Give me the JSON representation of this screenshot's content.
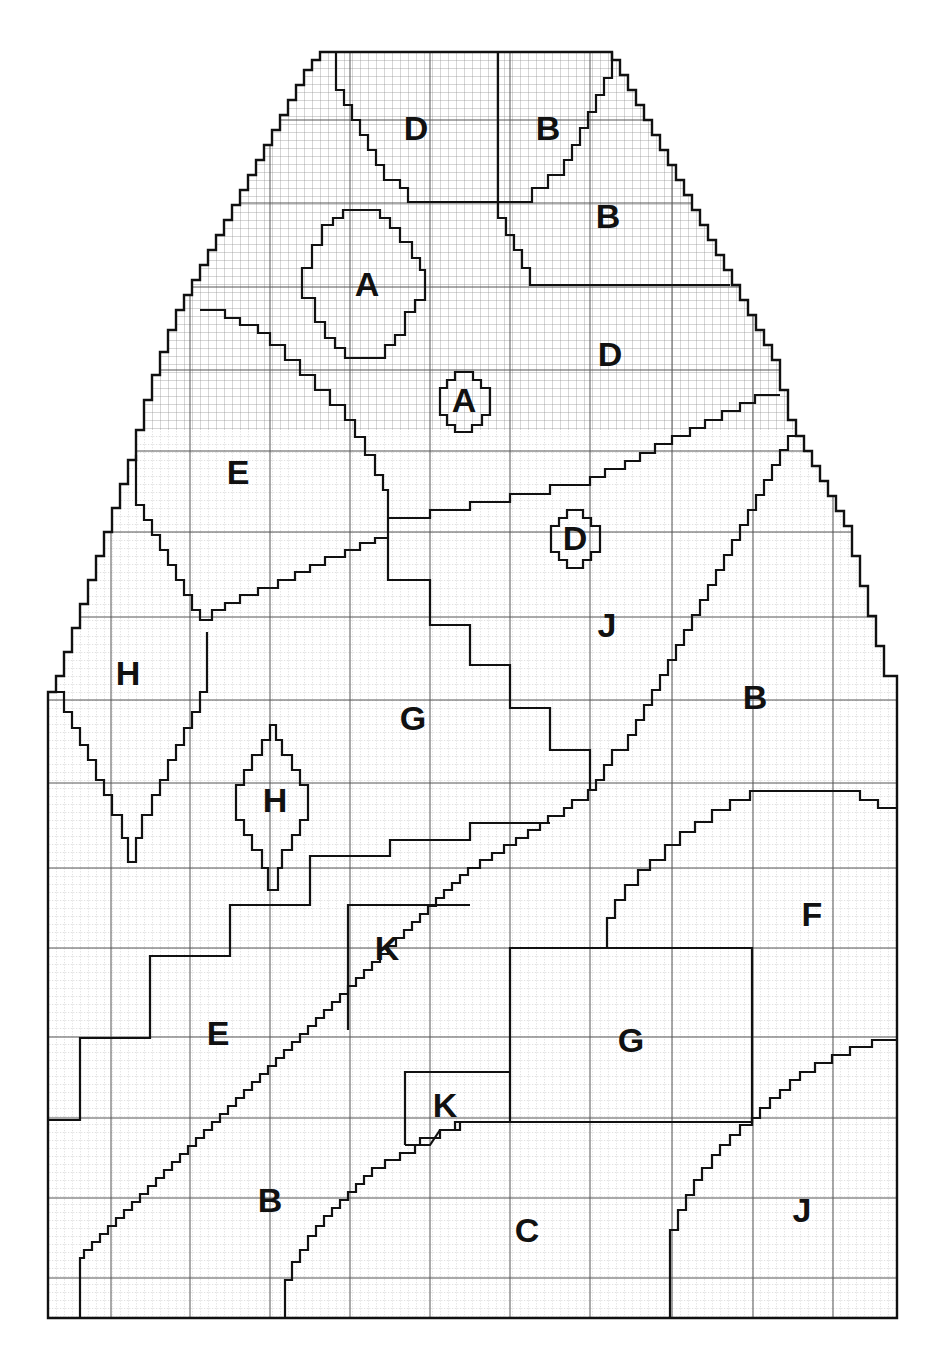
{
  "diagram": {
    "type": "color-chart-grid",
    "labels": [
      {
        "id": "D-top",
        "text": "D",
        "x": 416,
        "y": 128
      },
      {
        "id": "B-top",
        "text": "B",
        "x": 548,
        "y": 128
      },
      {
        "id": "B-upper-right",
        "text": "B",
        "x": 608,
        "y": 216
      },
      {
        "id": "A-large",
        "text": "A",
        "x": 367,
        "y": 284
      },
      {
        "id": "D-right",
        "text": "D",
        "x": 610,
        "y": 354
      },
      {
        "id": "A-small",
        "text": "A",
        "x": 464,
        "y": 400
      },
      {
        "id": "E-upper",
        "text": "E",
        "x": 238,
        "y": 472
      },
      {
        "id": "D-small",
        "text": "D",
        "x": 574,
        "y": 538
      },
      {
        "id": "J-middle",
        "text": "J",
        "x": 607,
        "y": 625
      },
      {
        "id": "H-left",
        "text": "H",
        "x": 128,
        "y": 673
      },
      {
        "id": "B-right",
        "text": "B",
        "x": 755,
        "y": 697
      },
      {
        "id": "G-middle",
        "text": "G",
        "x": 413,
        "y": 718
      },
      {
        "id": "H-small",
        "text": "H",
        "x": 275,
        "y": 800
      },
      {
        "id": "F",
        "text": "F",
        "x": 812,
        "y": 914
      },
      {
        "id": "K-upper",
        "text": "K",
        "x": 387,
        "y": 948
      },
      {
        "id": "E-lower",
        "text": "E",
        "x": 218,
        "y": 1033
      },
      {
        "id": "G-box",
        "text": "G",
        "x": 631,
        "y": 1040
      },
      {
        "id": "K-lower",
        "text": "K",
        "x": 445,
        "y": 1105
      },
      {
        "id": "B-lower",
        "text": "B",
        "x": 270,
        "y": 1200
      },
      {
        "id": "C",
        "text": "C",
        "x": 527,
        "y": 1230
      },
      {
        "id": "J-lower",
        "text": "J",
        "x": 802,
        "y": 1210
      }
    ],
    "grid": {
      "minor_cell_px": 8,
      "major_vertical_x": [
        48,
        111,
        190,
        270,
        350,
        430,
        510,
        590,
        672,
        753,
        833
      ],
      "major_horizontal_y": [
        120,
        203,
        287,
        370,
        451,
        532,
        617,
        700,
        783,
        868,
        948,
        1037,
        1118,
        1198,
        1278
      ]
    },
    "colors": {
      "line": "#111111",
      "grid": "#555555",
      "background": "#ffffff"
    }
  }
}
